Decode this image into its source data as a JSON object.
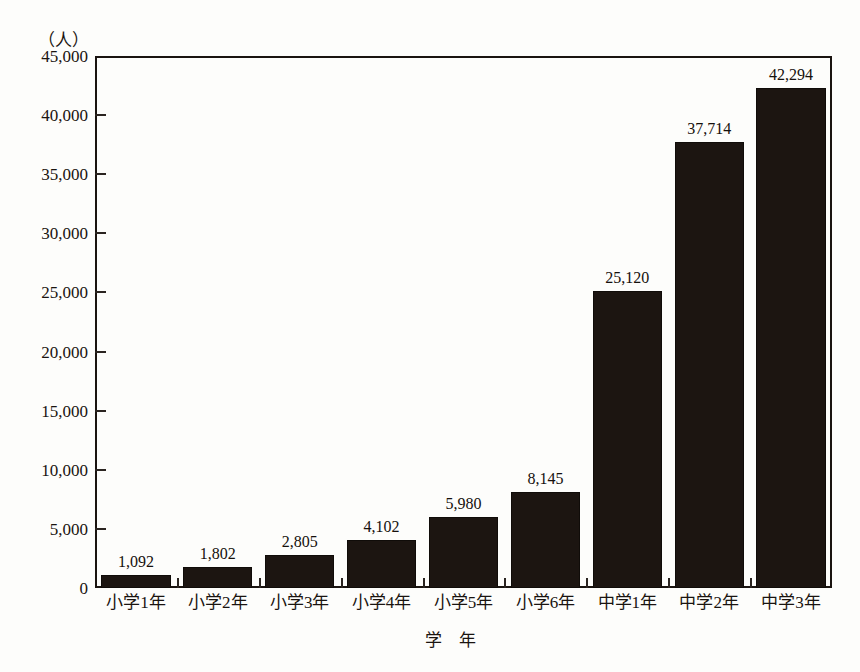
{
  "chart_data": {
    "type": "bar",
    "title": "",
    "subtitle": "",
    "xlabel": "学　年",
    "ylabel": "（人）",
    "y_unit_caption": "（人）",
    "categories": [
      "小学1年",
      "小学2年",
      "小学3年",
      "小学4年",
      "小学5年",
      "小学6年",
      "中学1年",
      "中学2年",
      "中学3年"
    ],
    "values": [
      1092,
      1802,
      2805,
      4102,
      5980,
      8145,
      25120,
      37714,
      42294
    ],
    "value_labels": [
      "1,092",
      "1,802",
      "2,805",
      "4,102",
      "5,980",
      "8,145",
      "25,120",
      "37,714",
      "42,294"
    ],
    "ylim": [
      0,
      45000
    ],
    "ytick_values": [
      0,
      5000,
      10000,
      15000,
      20000,
      25000,
      30000,
      35000,
      40000,
      45000
    ],
    "ytick_labels": [
      "0",
      "5,000",
      "10,000",
      "15,000",
      "20,000",
      "25,000",
      "30,000",
      "35,000",
      "40,000",
      "45,000"
    ],
    "grid": false,
    "legend": null,
    "legend_position": "none",
    "bar_color": "#1c1511",
    "background_color": "#fdfdfb",
    "axis_color": "#1a1410"
  }
}
